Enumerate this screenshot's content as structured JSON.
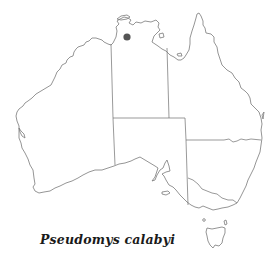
{
  "map": {
    "region": "Australia",
    "species_label": "Pseudomys calabyi",
    "occurrence_points": [
      {
        "x": 127,
        "y": 37,
        "r": 3.6,
        "color": "#555555",
        "label": "Kakadu / Arnhem Land, NT"
      }
    ],
    "colors": {
      "coast": "#7a7a7a",
      "borders": "#6e6e6e",
      "background": "#ffffff"
    }
  }
}
